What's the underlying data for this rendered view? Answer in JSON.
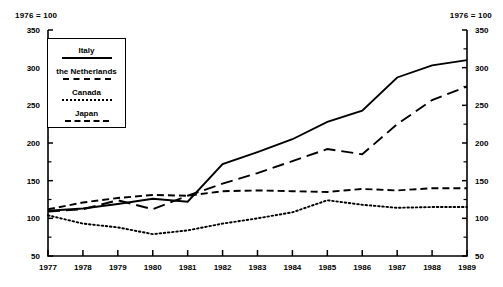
{
  "header": {
    "left_note": "1976 = 100",
    "right_note": "1976 = 100"
  },
  "legend": {
    "entries": [
      {
        "label": "Italy",
        "style": "solid"
      },
      {
        "label": "the Netherlands",
        "style": "dashed"
      },
      {
        "label": "Canada",
        "style": "dotted"
      },
      {
        "label": "Japan",
        "style": "long-dashed"
      }
    ]
  },
  "chart_data": {
    "type": "line",
    "title": "",
    "subtitle": "",
    "xlabel": "",
    "ylabel": "",
    "index_base_note": "1976 = 100",
    "x": [
      "1977",
      "1978",
      "1979",
      "1980",
      "1981",
      "1982",
      "1983",
      "1984",
      "1985",
      "1986",
      "1987",
      "1988",
      "1989"
    ],
    "xlim": [
      "1977",
      "1989"
    ],
    "ylim": [
      50,
      350
    ],
    "yticks": [
      50,
      100,
      150,
      200,
      250,
      300,
      350
    ],
    "yticks_minor": [
      75,
      125,
      175,
      225,
      275,
      325
    ],
    "grid": false,
    "legend_position": "upper-left-inside",
    "dual_y_axis": true,
    "series": [
      {
        "name": "Italy",
        "style": "solid",
        "values": [
          110,
          113,
          119,
          126,
          122,
          172,
          188,
          205,
          228,
          243,
          287,
          303,
          310
        ]
      },
      {
        "name": "the Netherlands",
        "style": "dashed",
        "values": [
          112,
          121,
          127,
          131,
          130,
          136,
          137,
          136,
          135,
          139,
          137,
          140,
          140
        ]
      },
      {
        "name": "Canada",
        "style": "dotted",
        "values": [
          104,
          93,
          88,
          79,
          84,
          93,
          100,
          108,
          124,
          118,
          114,
          115,
          115
        ]
      },
      {
        "name": "Japan",
        "style": "long-dashed",
        "values": [
          109,
          112,
          124,
          112,
          130,
          146,
          160,
          176,
          192,
          185,
          225,
          257,
          275
        ]
      }
    ]
  }
}
